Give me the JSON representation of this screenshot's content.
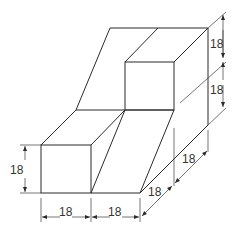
{
  "diagram": {
    "type": "isometric-technical-drawing",
    "colors": {
      "line": "#2b2b2b",
      "dimension": "#3a3a3a",
      "text": "#333333",
      "background": "#ffffff"
    },
    "dimensions": {
      "right_upper_height": "18",
      "right_lower_height": "18",
      "left_height": "18",
      "bottom_left_width": "18",
      "bottom_right_width": "18",
      "depth_front": "18",
      "depth_back": "18"
    }
  }
}
